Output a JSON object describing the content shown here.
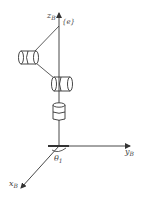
{
  "diagram": {
    "type": "robot-arm-kinematic-diagram",
    "axes": {
      "z": {
        "label": "z",
        "subscript": "B"
      },
      "y": {
        "label": "y",
        "subscript": "B"
      },
      "x": {
        "label": "x",
        "subscript": "B"
      }
    },
    "end_effector_frame": "{e}",
    "joint_angle": {
      "label": "θ",
      "subscript": "1"
    },
    "joints": [
      {
        "name": "joint-1",
        "orientation": "vertical-axis"
      },
      {
        "name": "joint-2",
        "orientation": "horizontal-axis"
      },
      {
        "name": "joint-3",
        "orientation": "horizontal-axis"
      }
    ],
    "colors": {
      "stroke": "#333333",
      "background": "#ffffff"
    }
  }
}
